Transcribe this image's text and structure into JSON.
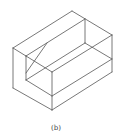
{
  "figure": {
    "caption": "(b)",
    "stroke_color": "#555555",
    "background": "#ffffff",
    "edges": [
      [
        13,
        48,
        72,
        11
      ],
      [
        72,
        11,
        112,
        35
      ],
      [
        112,
        35,
        112,
        72
      ],
      [
        13,
        48,
        13,
        88
      ],
      [
        13,
        88,
        52,
        110
      ],
      [
        52,
        110,
        112,
        72
      ],
      [
        13,
        48,
        26,
        56
      ],
      [
        26,
        56,
        85,
        19
      ],
      [
        85,
        19,
        85,
        43
      ],
      [
        26,
        56,
        26,
        80
      ],
      [
        26,
        56,
        52,
        72
      ],
      [
        52,
        72,
        112,
        35
      ],
      [
        52,
        72,
        52,
        110
      ],
      [
        26,
        80,
        85,
        43
      ],
      [
        85,
        43,
        112,
        59
      ],
      [
        26,
        80,
        52,
        96
      ],
      [
        52,
        96,
        112,
        59
      ],
      [
        47,
        43,
        26,
        73
      ]
    ]
  }
}
